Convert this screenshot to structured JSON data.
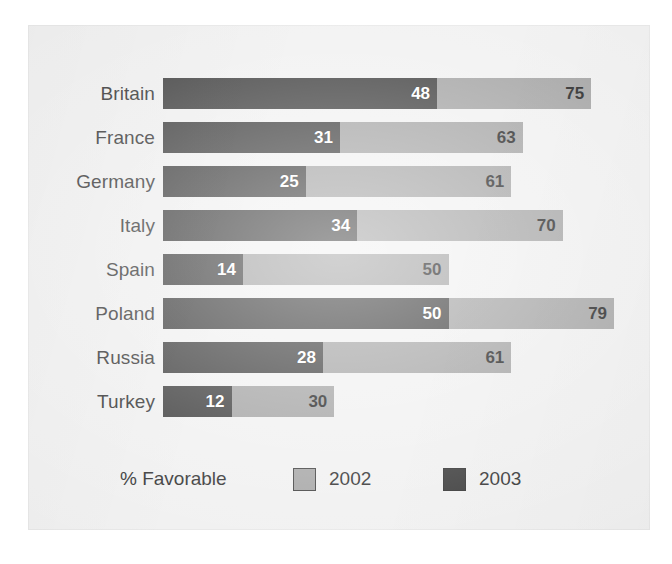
{
  "chart_data": {
    "type": "bar",
    "orientation": "horizontal",
    "title": "",
    "subtitle": "",
    "xlabel": "",
    "ylabel": "",
    "axis_note": "% Favorable",
    "grid": false,
    "legend_position": "bottom",
    "xlim": [
      0,
      100
    ],
    "categories": [
      "Britain",
      "France",
      "Germany",
      "Italy",
      "Spain",
      "Poland",
      "Russia",
      "Turkey"
    ],
    "series": [
      {
        "name": "2002",
        "color": "#9d9d9d",
        "values": [
          75,
          63,
          61,
          70,
          50,
          79,
          61,
          30
        ]
      },
      {
        "name": "2003",
        "color": "#323232",
        "values": [
          48,
          31,
          25,
          34,
          14,
          50,
          28,
          12
        ]
      }
    ],
    "rows": [
      {
        "label": "Britain",
        "v2002": 75,
        "v2003": 48
      },
      {
        "label": "France",
        "v2002": 63,
        "v2003": 31
      },
      {
        "label": "Germany",
        "v2002": 61,
        "v2003": 25
      },
      {
        "label": "Italy",
        "v2002": 70,
        "v2003": 34
      },
      {
        "label": "Spain",
        "v2002": 50,
        "v2003": 14
      },
      {
        "label": "Poland",
        "v2002": 79,
        "v2003": 50
      },
      {
        "label": "Russia",
        "v2002": 61,
        "v2003": 28
      },
      {
        "label": "Turkey",
        "v2002": 30,
        "v2003": 12
      }
    ]
  },
  "legend": {
    "title": "% Favorable",
    "entries": [
      {
        "label": "2002",
        "color": "#9d9d9d"
      },
      {
        "label": "2003",
        "color": "#323232"
      }
    ]
  },
  "colors": {
    "page_background": "#ffffff",
    "panel_background": "#f0f0f0",
    "series_2002": "#9d9d9d",
    "series_2003": "#323232",
    "text": "#2b2b2b",
    "value_on_dark": "#ffffff",
    "value_on_light": "#141414"
  }
}
